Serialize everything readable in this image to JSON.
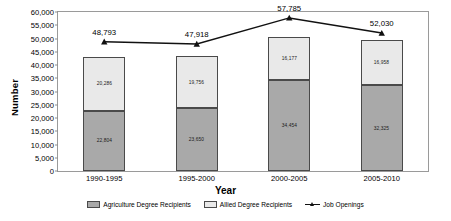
{
  "chart_data": {
    "type": "bar",
    "subtype": "stacked-bar-with-line-overlay",
    "title": "",
    "xlabel": "Year",
    "ylabel": "Number",
    "categories": [
      "1990-1995",
      "1995-2000",
      "2000-2005",
      "2005-2010"
    ],
    "ylim": [
      0,
      60000
    ],
    "ytick_interval": 5000,
    "ytick_labels": [
      "0",
      "5,000",
      "10,000",
      "15,000",
      "20,000",
      "25,000",
      "30,000",
      "35,000",
      "40,000",
      "45,000",
      "50,000",
      "55,000",
      "60,000"
    ],
    "ytick_values": [
      0,
      5000,
      10000,
      15000,
      20000,
      25000,
      30000,
      35000,
      40000,
      45000,
      50000,
      55000,
      60000
    ],
    "grid": false,
    "legend_position": "bottom",
    "series": [
      {
        "name": "Agriculture Degree Recipients",
        "type": "bar",
        "stack": "lower",
        "color": "#a9a9a9",
        "values": [
          22804,
          23650,
          34454,
          32325
        ],
        "labels": [
          "22,804",
          "23,650",
          "34,454",
          "32,325"
        ]
      },
      {
        "name": "Allied Degree Recipients",
        "type": "bar",
        "stack": "upper",
        "color": "#e9e9e9",
        "values": [
          20286,
          19756,
          16177,
          16958
        ],
        "labels": [
          "20,286",
          "19,756",
          "16,177",
          "16,958"
        ]
      },
      {
        "name": "Job Openings",
        "type": "line",
        "color": "#111111",
        "marker": "triangle",
        "values": [
          48793,
          47918,
          57785,
          52030
        ],
        "labels": [
          "48,793",
          "47,918",
          "57,785",
          "52,030"
        ]
      }
    ]
  },
  "axis": {
    "y_title": "Number",
    "x_title": "Year"
  }
}
